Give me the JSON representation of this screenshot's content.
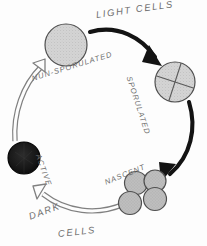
{
  "figure": {
    "background_color": "#fdfdfd",
    "ink_color": "#6e6e6e",
    "arrow_dark_color": "#111111",
    "arrow_outline_color": "#777777"
  },
  "labels": {
    "light_cells": "LIGHT  CELLS",
    "non_sporulated": "NUN-SPORULATED",
    "sporulated": "SPORULATED",
    "nascent": "NASCENT",
    "active": "ACTIVE",
    "dark": "DARK",
    "cells": "CELLS"
  },
  "nodes": [
    {
      "id": "non-sporulated",
      "label": "NUN-SPORULATED",
      "shape": "stippled-circle",
      "fill": "#d2d2d2",
      "stroke": "#4a4a4a",
      "cx": 66,
      "cy": 45,
      "r": 21
    },
    {
      "id": "sporulated",
      "label": "SPORULATED",
      "shape": "stippled-circle-with-cross",
      "fill": "#d2d2d2",
      "stroke": "#4a4a4a",
      "cx": 175,
      "cy": 82,
      "r": 20
    },
    {
      "id": "nascent",
      "label": "NASCENT",
      "shape": "stippled-circle-cluster",
      "fill": "#b9b9b9",
      "stroke": "#4a4a4a",
      "count": 4,
      "cx": 143,
      "cy": 193,
      "r": 12
    },
    {
      "id": "active",
      "label": "ACTIVE",
      "shape": "solid-dark-circle",
      "fill": "#1a1a1a",
      "stroke": "#000000",
      "cx": 24,
      "cy": 158,
      "r": 16
    }
  ],
  "arrows": [
    {
      "id": "non-sporulated-to-sporulated",
      "style": "solid-black",
      "from": "non-sporulated",
      "to": "sporulated",
      "group": "light_cells"
    },
    {
      "id": "sporulated-to-nascent",
      "style": "solid-black",
      "from": "sporulated",
      "to": "nascent",
      "group": "light_cells"
    },
    {
      "id": "nascent-to-active",
      "style": "hollow-outline",
      "from": "nascent",
      "to": "active",
      "group": "dark_cells"
    },
    {
      "id": "active-to-non-sporulated",
      "style": "hollow-outline",
      "from": "active",
      "to": "non-sporulated",
      "group": "dark_cells"
    }
  ]
}
